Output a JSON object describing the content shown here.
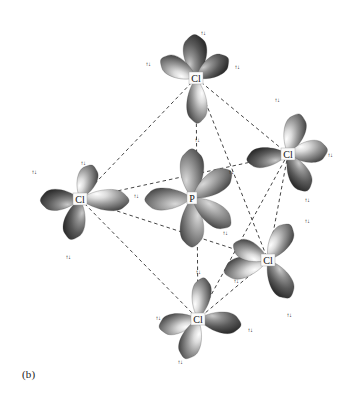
{
  "figure": {
    "caption": "(b)",
    "molecule": "PCl5",
    "geometry": "trigonal bipyramidal",
    "background_color": "#ffffff",
    "ink_color": "#141414"
  },
  "atoms": [
    {
      "id": "p-center",
      "label": "P",
      "x": 192,
      "y": 198,
      "role": "central"
    },
    {
      "id": "cl-top",
      "label": "Cl",
      "x": 196,
      "y": 78,
      "role": "axial"
    },
    {
      "id": "cl-left",
      "label": "Cl",
      "x": 80,
      "y": 199,
      "role": "equatorial"
    },
    {
      "id": "cl-right",
      "label": "Cl",
      "x": 288,
      "y": 154,
      "role": "equatorial"
    },
    {
      "id": "cl-lower-right",
      "label": "Cl",
      "x": 268,
      "y": 260,
      "role": "equatorial"
    },
    {
      "id": "cl-bottom",
      "label": "Cl",
      "x": 198,
      "y": 319,
      "role": "axial"
    }
  ],
  "orbital_lobes": [
    {
      "atom": "cl-top",
      "angle": -92,
      "len": 46,
      "wid": 30,
      "tone": "dark",
      "spin": "↑↓",
      "lx": 203,
      "ly": 33
    },
    {
      "atom": "cl-top",
      "angle": -152,
      "len": 42,
      "wid": 26,
      "tone": "light",
      "spin": "↑↓",
      "lx": 148,
      "ly": 64
    },
    {
      "atom": "cl-top",
      "angle": -32,
      "len": 40,
      "wid": 26,
      "tone": "dark",
      "spin": "↑↓",
      "lx": 237,
      "ly": 67
    },
    {
      "atom": "cl-top",
      "angle": 88,
      "len": 48,
      "wid": 26,
      "tone": "light",
      "spin": "↑↓",
      "lx": 197,
      "ly": 140
    },
    {
      "atom": "cl-left",
      "angle": 178,
      "len": 42,
      "wid": 27,
      "tone": "dark",
      "spin": "↑↓",
      "lx": 34,
      "ly": 172
    },
    {
      "atom": "cl-left",
      "angle": -70,
      "len": 38,
      "wid": 25,
      "tone": "light",
      "spin": "↑↓",
      "lx": 83,
      "ly": 163
    },
    {
      "atom": "cl-left",
      "angle": 103,
      "len": 44,
      "wid": 27,
      "tone": "dark",
      "spin": "↑↓",
      "lx": 68,
      "ly": 257
    },
    {
      "atom": "cl-left",
      "angle": 2,
      "len": 52,
      "wid": 27,
      "tone": "light",
      "spin": "↑↓",
      "lx": 136,
      "ly": 196
    },
    {
      "atom": "cl-right",
      "angle": -74,
      "len": 44,
      "wid": 27,
      "tone": "light",
      "spin": "↑↓",
      "lx": 277,
      "ly": 100
    },
    {
      "atom": "cl-right",
      "angle": -6,
      "len": 42,
      "wid": 28,
      "tone": "light",
      "spin": "↑↓",
      "lx": 330,
      "ly": 155
    },
    {
      "atom": "cl-right",
      "angle": 62,
      "len": 44,
      "wid": 27,
      "tone": "dark",
      "spin": "↑↓",
      "lx": 307,
      "ly": 200
    },
    {
      "atom": "cl-right",
      "angle": 172,
      "len": 44,
      "wid": 25,
      "tone": "dark",
      "spin": "↑↓",
      "lx": 231,
      "ly": 172
    },
    {
      "atom": "cl-lower-right",
      "angle": -58,
      "len": 44,
      "wid": 27,
      "tone": "light",
      "spin": "↑↓",
      "lx": 307,
      "ly": 221
    },
    {
      "atom": "cl-lower-right",
      "angle": 60,
      "len": 46,
      "wid": 28,
      "tone": "dark",
      "spin": "↑↓",
      "lx": 289,
      "ly": 315
    },
    {
      "atom": "cl-lower-right",
      "angle": 164,
      "len": 48,
      "wid": 27,
      "tone": "light",
      "spin": "↑↓",
      "lx": 225,
      "ly": 233
    },
    {
      "atom": "cl-lower-right",
      "angle": 205,
      "len": 40,
      "wid": 25,
      "tone": "light",
      "spin": "↑↓",
      "lx": 236,
      "ly": 281
    },
    {
      "atom": "cl-bottom",
      "angle": 168,
      "len": 42,
      "wid": 26,
      "tone": "light",
      "spin": "↑↓",
      "lx": 158,
      "ly": 318
    },
    {
      "atom": "cl-bottom",
      "angle": 108,
      "len": 44,
      "wid": 27,
      "tone": "light",
      "spin": "↑↓",
      "lx": 180,
      "ly": 362
    },
    {
      "atom": "cl-bottom",
      "angle": 8,
      "len": 46,
      "wid": 27,
      "tone": "dark",
      "spin": "↑↓",
      "lx": 250,
      "ly": 330
    },
    {
      "atom": "cl-bottom",
      "angle": -82,
      "len": 44,
      "wid": 24,
      "tone": "light",
      "spin": "↑↓",
      "lx": 198,
      "ly": 272
    },
    {
      "atom": "p-center",
      "angle": -90,
      "len": 52,
      "wid": 30,
      "tone": "mid",
      "spin": "",
      "lx": 0,
      "ly": 0
    },
    {
      "atom": "p-center",
      "angle": 90,
      "len": 52,
      "wid": 30,
      "tone": "mid",
      "spin": "",
      "lx": 0,
      "ly": 0
    },
    {
      "atom": "p-center",
      "angle": 178,
      "len": 50,
      "wid": 28,
      "tone": "mid",
      "spin": "",
      "lx": 0,
      "ly": 0
    },
    {
      "atom": "p-center",
      "angle": -34,
      "len": 50,
      "wid": 28,
      "tone": "mid",
      "spin": "",
      "lx": 0,
      "ly": 0
    },
    {
      "atom": "p-center",
      "angle": 36,
      "len": 50,
      "wid": 28,
      "tone": "mid",
      "spin": "",
      "lx": 0,
      "ly": 0
    }
  ],
  "bond_lines": [
    {
      "from": "cl-top",
      "to": "cl-left"
    },
    {
      "from": "cl-top",
      "to": "cl-right"
    },
    {
      "from": "cl-top",
      "to": "cl-lower-right"
    },
    {
      "from": "cl-left",
      "to": "cl-right"
    },
    {
      "from": "cl-left",
      "to": "cl-lower-right"
    },
    {
      "from": "cl-left",
      "to": "cl-bottom"
    },
    {
      "from": "cl-right",
      "to": "cl-lower-right"
    },
    {
      "from": "cl-right",
      "to": "cl-bottom"
    },
    {
      "from": "cl-lower-right",
      "to": "cl-bottom"
    },
    {
      "from": "cl-top",
      "to": "cl-bottom"
    }
  ]
}
